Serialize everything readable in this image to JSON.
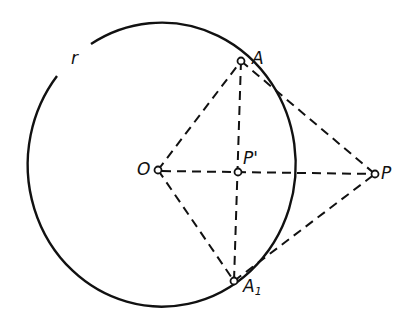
{
  "diagram": {
    "colors": {
      "stroke": "#111111",
      "background": "#ffffff"
    },
    "circle": {
      "label": "r",
      "center_label": "O"
    },
    "points": {
      "O": {
        "label": "O"
      },
      "A": {
        "label": "A"
      },
      "A1": {
        "label": "A",
        "sub": "1"
      },
      "P": {
        "label": "P"
      },
      "Pprime": {
        "label": "P'"
      }
    },
    "segments": [
      "OA",
      "OA1",
      "OP",
      "AA1",
      "PA",
      "PA1"
    ]
  }
}
